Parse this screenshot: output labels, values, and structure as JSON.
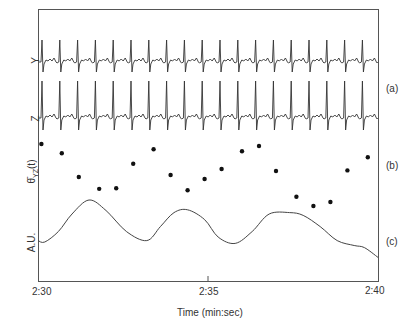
{
  "chart_data": {
    "type": "line",
    "title": "",
    "xlabel": "Time (min:sec)",
    "x_ticks": [
      "2:30",
      "2:35",
      "2:40"
    ],
    "x_range_seconds": [
      150,
      160
    ],
    "grid": false,
    "legend": null,
    "panels": [
      {
        "id": "a",
        "panel_label": "(a)",
        "description": "Two ECG leads (Y and Z), approx 19 beats over 10 s",
        "series": [
          {
            "name": "Y",
            "ylabel": "Y",
            "type": "ecg",
            "beat_times_s": [
              150.2,
              151.3,
              152.4,
              153.4,
              154.4,
              155.4,
              156.5,
              157.5,
              158.6,
              159.6,
              150.76,
              151.8,
              152.9,
              153.9,
              154.9,
              156.0,
              157.0,
              158.1,
              159.1
            ]
          },
          {
            "name": "Z",
            "ylabel": "Z",
            "type": "ecg"
          }
        ]
      },
      {
        "id": "b",
        "panel_label": "(b)",
        "ylabel": "θ̄_YZ(t)",
        "type": "scatter",
        "description": "Beat-to-beat mean angle between Y and Z leads (relative position, 0 = low, 1 = high)",
        "x": [
          150.1,
          150.7,
          151.2,
          151.8,
          152.3,
          152.8,
          153.4,
          153.9,
          154.4,
          154.9,
          155.4,
          156.0,
          156.5,
          157.0,
          157.6,
          158.1,
          158.6,
          159.1,
          159.7
        ],
        "values": [
          0.97,
          0.83,
          0.47,
          0.29,
          0.3,
          0.67,
          0.89,
          0.5,
          0.27,
          0.44,
          0.59,
          0.86,
          0.94,
          0.56,
          0.17,
          0.03,
          0.09,
          0.57,
          0.77
        ]
      },
      {
        "id": "c",
        "panel_label": "(c)",
        "ylabel": "A.U.",
        "type": "line",
        "description": "Slow oscillation (respiration-like), arbitrary units",
        "x": [
          150.0,
          150.2,
          150.6,
          151.0,
          151.5,
          152.0,
          152.6,
          153.2,
          153.6,
          154.0,
          154.4,
          154.9,
          155.3,
          155.8,
          156.3,
          156.8,
          157.4,
          157.8,
          158.3,
          158.8,
          159.3,
          159.6,
          160.0
        ],
        "values": [
          0.42,
          0.4,
          0.55,
          0.8,
          1.0,
          0.85,
          0.55,
          0.42,
          0.62,
          0.82,
          0.86,
          0.72,
          0.47,
          0.38,
          0.55,
          0.8,
          0.82,
          0.78,
          0.62,
          0.42,
          0.35,
          0.32,
          0.18
        ]
      }
    ]
  },
  "labels": {
    "y_lead": "Y",
    "z_lead": "Z",
    "theta_label": "θ̄",
    "theta_sub": "YZ",
    "theta_arg": "(t)",
    "au_label": "A.U.",
    "panel_a": "(a)",
    "panel_b": "(b)",
    "panel_c": "(c)",
    "xtick_0": "2:30",
    "xtick_1": "2:35",
    "xtick_2": "2:40",
    "xlabel": "Time (min:sec)"
  },
  "colors": {
    "trace": "#333333",
    "frame": "#555555",
    "dots": "#111111"
  }
}
